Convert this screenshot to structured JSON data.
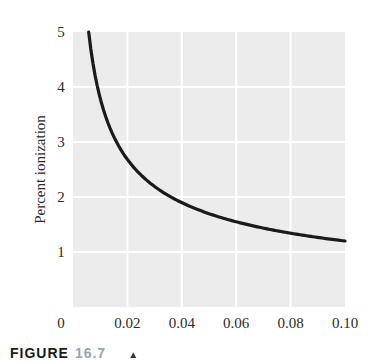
{
  "chart_data": {
    "type": "line",
    "title": "",
    "xlabel": "",
    "ylabel": "Percent ionization",
    "xlim": [
      0,
      0.1
    ],
    "ylim": [
      0,
      5
    ],
    "x_ticks": [
      "0",
      "0.02",
      "0.04",
      "0.06",
      "0.08",
      "0.10"
    ],
    "y_ticks": [
      "1",
      "2",
      "3",
      "4",
      "5"
    ],
    "grid": true,
    "legend": null,
    "series": [
      {
        "name": "Percent ionization vs concentration",
        "x": [
          0.006,
          0.008,
          0.01,
          0.015,
          0.02,
          0.03,
          0.04,
          0.05,
          0.06,
          0.07,
          0.08,
          0.09,
          0.1
        ],
        "y": [
          4.9,
          4.24,
          3.79,
          3.1,
          2.68,
          2.19,
          1.9,
          1.7,
          1.55,
          1.43,
          1.34,
          1.26,
          1.2
        ]
      }
    ]
  },
  "caption": {
    "label": "FIGURE",
    "number": "16.7",
    "marker": "▲"
  }
}
